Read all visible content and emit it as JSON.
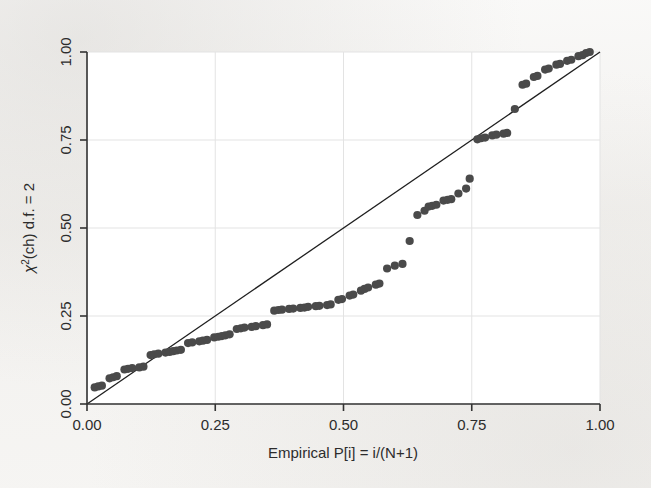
{
  "figure": {
    "background_color": "#f4f3f1",
    "plot_background_color": "#ffffff",
    "marker_color": "#4a4a4a",
    "line_color": "#1f1f1f",
    "grid_color": "#e3e3e3",
    "axis_color": "#333333"
  },
  "axes": {
    "x_title": "Empirical P[i] = i/(N+1)",
    "y_title_parts": {
      "chi": "χ",
      "sup": "2",
      "rest": "(ch) d.f. = 2"
    },
    "y_title_plain": "χ²(ch) d.f. = 2",
    "x_tick_labels": [
      "0.00",
      "0.25",
      "0.50",
      "0.75",
      "1.00"
    ],
    "y_tick_labels": [
      "0.00",
      "0.25",
      "0.50",
      "0.75",
      "1.00"
    ],
    "x_tick_values": [
      0.0,
      0.25,
      0.5,
      0.75,
      1.0
    ],
    "y_tick_values": [
      0.0,
      0.25,
      0.5,
      0.75,
      1.0
    ]
  },
  "chart_data": {
    "type": "scatter",
    "title": "",
    "subtitle": "",
    "xlabel": "Empirical P[i] = i/(N+1)",
    "ylabel": "χ²(ch) d.f. = 2",
    "xlim": [
      0.0,
      1.0
    ],
    "ylim": [
      0.0,
      1.0
    ],
    "grid": true,
    "legend": "none",
    "reference_line": {
      "name": "45-degree reference line",
      "x": [
        0.0,
        1.0
      ],
      "y": [
        0.0,
        1.0
      ],
      "style": "solid",
      "color": "#1f1f1f"
    },
    "series": [
      {
        "name": "chi2(ch) quantiles vs empirical P[i]",
        "marker": "filled-circle",
        "color": "#4a4a4a",
        "points": [
          [
            0.015,
            0.047
          ],
          [
            0.022,
            0.05
          ],
          [
            0.029,
            0.052
          ],
          [
            0.044,
            0.073
          ],
          [
            0.051,
            0.076
          ],
          [
            0.058,
            0.079
          ],
          [
            0.073,
            0.098
          ],
          [
            0.08,
            0.1
          ],
          [
            0.088,
            0.102
          ],
          [
            0.102,
            0.104
          ],
          [
            0.11,
            0.106
          ],
          [
            0.124,
            0.139
          ],
          [
            0.131,
            0.141
          ],
          [
            0.139,
            0.143
          ],
          [
            0.153,
            0.146
          ],
          [
            0.161,
            0.148
          ],
          [
            0.168,
            0.15
          ],
          [
            0.175,
            0.152
          ],
          [
            0.183,
            0.154
          ],
          [
            0.197,
            0.173
          ],
          [
            0.205,
            0.175
          ],
          [
            0.219,
            0.178
          ],
          [
            0.226,
            0.18
          ],
          [
            0.234,
            0.182
          ],
          [
            0.248,
            0.189
          ],
          [
            0.256,
            0.191
          ],
          [
            0.263,
            0.193
          ],
          [
            0.27,
            0.195
          ],
          [
            0.278,
            0.198
          ],
          [
            0.292,
            0.213
          ],
          [
            0.3,
            0.215
          ],
          [
            0.307,
            0.217
          ],
          [
            0.321,
            0.219
          ],
          [
            0.329,
            0.221
          ],
          [
            0.343,
            0.224
          ],
          [
            0.351,
            0.226
          ],
          [
            0.365,
            0.265
          ],
          [
            0.373,
            0.267
          ],
          [
            0.38,
            0.268
          ],
          [
            0.394,
            0.27
          ],
          [
            0.402,
            0.271
          ],
          [
            0.416,
            0.273
          ],
          [
            0.424,
            0.274
          ],
          [
            0.431,
            0.276
          ],
          [
            0.446,
            0.278
          ],
          [
            0.453,
            0.279
          ],
          [
            0.468,
            0.281
          ],
          [
            0.475,
            0.283
          ],
          [
            0.49,
            0.296
          ],
          [
            0.497,
            0.298
          ],
          [
            0.512,
            0.308
          ],
          [
            0.519,
            0.311
          ],
          [
            0.534,
            0.322
          ],
          [
            0.541,
            0.327
          ],
          [
            0.548,
            0.331
          ],
          [
            0.563,
            0.339
          ],
          [
            0.57,
            0.342
          ],
          [
            0.585,
            0.385
          ],
          [
            0.6,
            0.393
          ],
          [
            0.615,
            0.398
          ],
          [
            0.629,
            0.463
          ],
          [
            0.644,
            0.537
          ],
          [
            0.658,
            0.549
          ],
          [
            0.666,
            0.561
          ],
          [
            0.673,
            0.563
          ],
          [
            0.681,
            0.566
          ],
          [
            0.695,
            0.578
          ],
          [
            0.703,
            0.58
          ],
          [
            0.71,
            0.582
          ],
          [
            0.724,
            0.598
          ],
          [
            0.739,
            0.612
          ],
          [
            0.746,
            0.64
          ],
          [
            0.761,
            0.752
          ],
          [
            0.768,
            0.755
          ],
          [
            0.776,
            0.757
          ],
          [
            0.79,
            0.763
          ],
          [
            0.798,
            0.765
          ],
          [
            0.812,
            0.768
          ],
          [
            0.819,
            0.77
          ],
          [
            0.834,
            0.838
          ],
          [
            0.849,
            0.907
          ],
          [
            0.856,
            0.91
          ],
          [
            0.871,
            0.929
          ],
          [
            0.878,
            0.932
          ],
          [
            0.893,
            0.95
          ],
          [
            0.9,
            0.953
          ],
          [
            0.915,
            0.964
          ],
          [
            0.922,
            0.966
          ],
          [
            0.936,
            0.975
          ],
          [
            0.944,
            0.978
          ],
          [
            0.958,
            0.988
          ],
          [
            0.966,
            0.991
          ],
          [
            0.973,
            0.997
          ],
          [
            0.98,
            1.0
          ]
        ]
      }
    ]
  }
}
